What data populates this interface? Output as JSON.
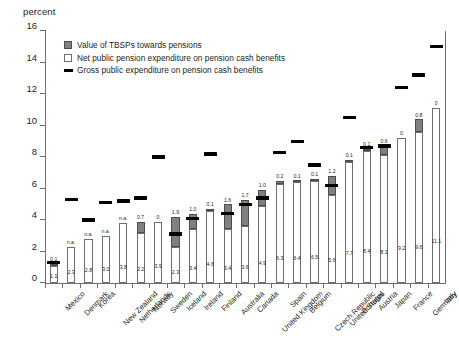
{
  "chart_data": {
    "type": "bar",
    "title": "",
    "ylabel": "percent",
    "xlabel": "",
    "ylim": [
      0,
      16
    ],
    "yticks": [
      0,
      2,
      4,
      6,
      8,
      10,
      12,
      14,
      16
    ],
    "grid": false,
    "legend_position": "top-left",
    "stacked": true,
    "categories": [
      "Mexico",
      "Denmark",
      "Korea",
      "New Zealand",
      "Netherlands",
      "Norway",
      "Sweden",
      "Iceland",
      "Ireland",
      "Finland",
      "Australia",
      "Canada",
      "United Kingdom",
      "Spain",
      "Belgium",
      "Czech Republic",
      "United States",
      "Portugal",
      "Austria",
      "Japan",
      "France",
      "Germany",
      "Italy"
    ],
    "series": [
      {
        "name": "Net public pension expenditure on pension cash benefits",
        "type": "bar-segment",
        "values": [
          1.1,
          2.3,
          2.8,
          3.0,
          3.8,
          3.2,
          3.9,
          2.3,
          3.4,
          4.6,
          3.4,
          3.6,
          4.9,
          6.3,
          6.4,
          6.5,
          5.6,
          7.7,
          8.4,
          8.1,
          9.2,
          9.6,
          11.1
        ],
        "labels": [
          "1.1",
          "2.3",
          "2.8",
          "3.0",
          "3.8",
          "3.2",
          "3.9",
          "2.3",
          "3.4",
          "4.6",
          "3.4",
          "3.6",
          "4.9",
          "6.3",
          "6.4",
          "6.5",
          "5.6",
          "7.7",
          "8.4",
          "8.1",
          "9.2",
          "9.6",
          "11.1"
        ]
      },
      {
        "name": "Value of TBSPs towards pensions",
        "type": "bar-segment",
        "values": [
          0.1,
          0,
          0,
          0,
          0,
          0.7,
          0,
          1.9,
          1.0,
          0.1,
          1.6,
          1.7,
          1.0,
          0.2,
          0.1,
          0.1,
          1.2,
          0.1,
          0.1,
          0.6,
          0,
          0.8,
          0
        ],
        "labels": [
          "0.1",
          "n.a.",
          "n.a.",
          "n.a.",
          "n.a.",
          "0.7",
          "0",
          "1.9",
          "1.0",
          "0.1",
          "1.6",
          "1.7",
          "1.0",
          "0.2",
          "0.1",
          "0.1",
          "1.2",
          "0.1",
          "0.1",
          "0.6",
          "0",
          "0.8",
          "0"
        ]
      },
      {
        "name": "Gross public expenditure on pension cash benefits",
        "type": "marker",
        "values": [
          1.3,
          5.3,
          4.0,
          5.1,
          5.2,
          5.4,
          8.0,
          3.1,
          4.1,
          8.2,
          4.4,
          5.0,
          5.4,
          8.3,
          9.0,
          7.5,
          6.2,
          10.5,
          8.6,
          8.7,
          12.4,
          13.2,
          15.0
        ]
      }
    ]
  },
  "legend": {
    "items": [
      "Value of TBSPs towards pensions",
      "Net public pension expenditure on pension cash benefits",
      "Gross public expenditure on pension cash benefits"
    ]
  },
  "colors": {
    "tbsp": "#808080",
    "net": "#ffffff",
    "gross": "#000000",
    "axis": "#6e6e6e",
    "text": "#231f20"
  }
}
